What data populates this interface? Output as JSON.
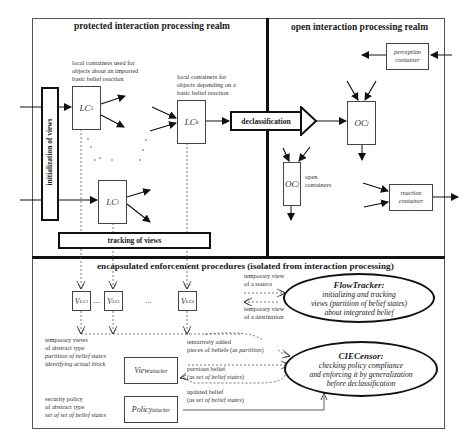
{
  "realms": {
    "protected": {
      "title": "protected interaction processing realm"
    },
    "open": {
      "title": "open interaction processing realm"
    },
    "enforcement": {
      "title": "encapsulated enforcement procedures (isolated from interaction processing)"
    }
  },
  "protected": {
    "initialization_label": "initialization of views",
    "tracking_label": "tracking of views",
    "declassification_label": "declassification",
    "note_lc1": [
      "local containers used for",
      "objects about an imported",
      "basic belief reaction"
    ],
    "note_lck": [
      "local containers for",
      "objects depending on a",
      "basic belief reaction"
    ],
    "containers": {
      "lc1": {
        "base": "LC",
        "sub": "1"
      },
      "lck": {
        "base": "LC",
        "sub": "k"
      },
      "lci": {
        "base": "LC",
        "sub": "i"
      }
    }
  },
  "open": {
    "perception_container": [
      "perception",
      "container"
    ],
    "reaction_container": [
      "reaction",
      "container"
    ],
    "open_containers_note": [
      "open",
      "containers"
    ],
    "containers": {
      "ocj_upper": {
        "base": "OC",
        "sub": "j"
      },
      "ocj_lower": {
        "base": "OC",
        "sub": "j"
      }
    }
  },
  "enforcement": {
    "views": {
      "v1": {
        "base": "V",
        "sub": "LC1"
      },
      "vi": {
        "base": "V",
        "sub": "LCi"
      },
      "vk": {
        "base": "V",
        "sub": "LCk"
      },
      "ellipsis": "..."
    },
    "note_temp_views": [
      "temporary views",
      "of abstract type"
    ],
    "note_temp_views_it": [
      "partition of belief states",
      "identifying actual block"
    ],
    "note_security": [
      "security policy",
      "of abstract type"
    ],
    "note_security_it": "set of set of belief states",
    "view_attacker": {
      "base": "View",
      "sub": "attacker"
    },
    "policy_attacker": {
      "base": "Policy",
      "sub": "attacker"
    },
    "note_source": [
      "temporary view",
      "of a source"
    ],
    "note_destination": [
      "temporary view",
      "of a destination"
    ],
    "note_tentative": {
      "line1": "tentatively added",
      "line2": "pieces of beliefs (as ",
      "line2_it": "partition",
      "line2_end": ")"
    },
    "note_previous": {
      "line1": "previous  belief",
      "line2_open": "(as ",
      "line2_it": "set of belief states",
      "line2_close": ")"
    },
    "note_updated": {
      "line1": "updated  belief",
      "line2_open": "(as ",
      "line2_it": "set of belief states",
      "line2_close": ")"
    },
    "flowtracker": {
      "name": "FlowTracker",
      "punct": ":",
      "lines": [
        "initializing and tracking",
        "views (partition of belief states)",
        "about integrated belief"
      ]
    },
    "ciecensor": {
      "name": "CIECensor",
      "punct": ":",
      "lines": [
        "checking policy compliance",
        "and enforcing it by generalization",
        "before declassification"
      ]
    }
  }
}
